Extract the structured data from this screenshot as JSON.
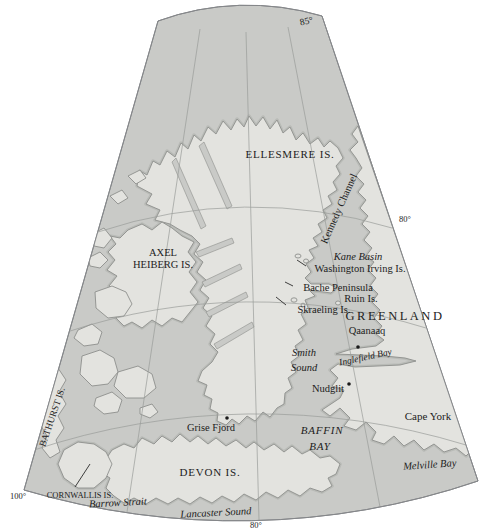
{
  "graticule": {
    "lat_top": "85°",
    "lat_right": "80°",
    "lon_bottom_left": "100°",
    "lon_bottom_center": "80°"
  },
  "regions": {
    "ellesmere": "ELLESMERE IS.",
    "axel_line1": "AXEL",
    "axel_line2": "HEIBERG IS.",
    "greenland": "GREENLAND",
    "devon": "DEVON IS.",
    "bathurst": "BATHURST IS.",
    "cornwallis": "CORNWALLIS IS."
  },
  "places": {
    "washington_irving": "Washington Irving Is.",
    "bache": "Bache Peninsula",
    "ruin": "Ruin Is.",
    "skraeling": "Skraeling Is.",
    "qaanaaq": "Qaanaaq",
    "nudglit": "Nudglit",
    "grise_fjord": "Grise Fjord",
    "cape_york": "Cape York"
  },
  "waters": {
    "kennedy": "Kennedy Channel",
    "kane": "Kane Basin",
    "smith_line1": "Smith",
    "smith_line2": "Sound",
    "inglefield": "Inglefield Bay",
    "baffin_line1": "BAFFIN",
    "baffin_line2": "BAY",
    "melville": "Melville Bay",
    "barrow": "Barrow Strait",
    "lancaster": "Lancaster Sound"
  },
  "theme": {
    "sea": "#c9cac7",
    "land": "#e3e3df",
    "coast": "#8d8f8c",
    "halo": "#b9bbb7",
    "grat": "#9a9c99",
    "edge": "#85878a",
    "label": "#1c1c1c",
    "bg": "#ffffff"
  }
}
